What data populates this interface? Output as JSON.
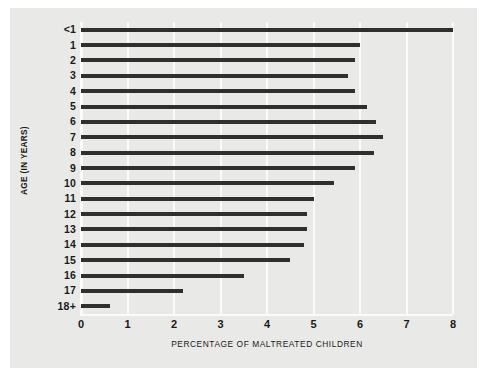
{
  "chart_data": {
    "type": "bar",
    "orientation": "horizontal",
    "title": "",
    "subtitle": "",
    "xlabel": "PERCENTAGE OF MALTREATED CHILDREN",
    "ylabel": "AGE (IN YEARS)",
    "xlim": [
      0,
      8
    ],
    "xticks": [
      0,
      1,
      2,
      3,
      4,
      5,
      6,
      7,
      8
    ],
    "xtick_labels": [
      "0",
      "1",
      "2",
      "3",
      "4",
      "5",
      "6",
      "7",
      "8"
    ],
    "grid": "vertical",
    "legend": "none",
    "bar_color": "#2f2f2f",
    "plot_background": "#e9e9e7",
    "gridline_color": "#fbfbfa",
    "categories": [
      "<1",
      "1",
      "2",
      "3",
      "4",
      "5",
      "6",
      "7",
      "8",
      "9",
      "10",
      "11",
      "12",
      "13",
      "14",
      "15",
      "16",
      "17",
      "18+"
    ],
    "values": [
      8.0,
      6.0,
      5.9,
      5.75,
      5.9,
      6.15,
      6.35,
      6.5,
      6.3,
      5.9,
      5.45,
      5.0,
      4.85,
      4.85,
      4.8,
      4.5,
      3.5,
      2.2,
      0.62
    ],
    "data_points": [
      {
        "category": "<1",
        "value": 8.0
      },
      {
        "category": "1",
        "value": 6.0
      },
      {
        "category": "2",
        "value": 5.9
      },
      {
        "category": "3",
        "value": 5.75
      },
      {
        "category": "4",
        "value": 5.9
      },
      {
        "category": "5",
        "value": 6.15
      },
      {
        "category": "6",
        "value": 6.35
      },
      {
        "category": "7",
        "value": 6.5
      },
      {
        "category": "8",
        "value": 6.3
      },
      {
        "category": "9",
        "value": 5.9
      },
      {
        "category": "10",
        "value": 5.45
      },
      {
        "category": "11",
        "value": 5.0
      },
      {
        "category": "12",
        "value": 4.85
      },
      {
        "category": "13",
        "value": 4.85
      },
      {
        "category": "14",
        "value": 4.8
      },
      {
        "category": "15",
        "value": 4.5
      },
      {
        "category": "16",
        "value": 3.5
      },
      {
        "category": "17",
        "value": 2.2
      },
      {
        "category": "18+",
        "value": 0.62
      }
    ]
  }
}
